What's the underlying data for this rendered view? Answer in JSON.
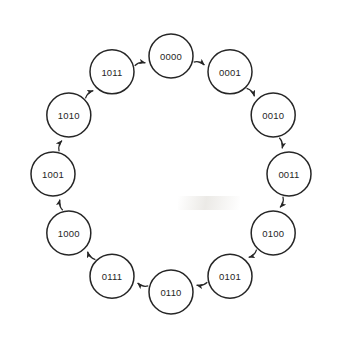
{
  "diagram": {
    "title": "",
    "type": "state-transition-cycle",
    "background_color": "#ffffff",
    "stroke_color": "#262626",
    "text_color": "#262626",
    "node_fill": "#ffffff",
    "node_radius": 22,
    "ring_radius": 118,
    "center_x": 171,
    "center_y": 174,
    "direction": "clockwise",
    "states": [
      {
        "label": "0000",
        "angle_deg": -90,
        "cx": 171,
        "cy": 56
      },
      {
        "label": "0001",
        "angle_deg": -60,
        "cx": 273,
        "cy": 115
      },
      {
        "label": "0010",
        "angle_deg": -30,
        "cx": 273,
        "cy": 115
      },
      {
        "label": "0011",
        "angle_deg": 0,
        "cx": 289,
        "cy": 174
      },
      {
        "label": "0100",
        "angle_deg": 30,
        "cx": 273,
        "cy": 233
      },
      {
        "label": "0101",
        "angle_deg": 60,
        "cx": 230,
        "cy": 276
      },
      {
        "label": "0110",
        "angle_deg": 90,
        "cx": 171,
        "cy": 292
      },
      {
        "label": "0111",
        "angle_deg": 120,
        "cx": 112,
        "cy": 276
      },
      {
        "label": "1000",
        "angle_deg": 150,
        "cx": 69,
        "cy": 233
      },
      {
        "label": "1001",
        "angle_deg": 180,
        "cx": 53,
        "cy": 174
      },
      {
        "label": "1010",
        "angle_deg": 210,
        "cx": 69,
        "cy": 115
      },
      {
        "label": "1011",
        "angle_deg": 240,
        "cx": 112,
        "cy": 72
      }
    ],
    "transitions": [
      {
        "from": "0000",
        "to": "0001"
      },
      {
        "from": "0001",
        "to": "0010"
      },
      {
        "from": "0010",
        "to": "0011"
      },
      {
        "from": "0011",
        "to": "0100"
      },
      {
        "from": "0100",
        "to": "0101"
      },
      {
        "from": "0101",
        "to": "0110"
      },
      {
        "from": "0110",
        "to": "0111"
      },
      {
        "from": "0111",
        "to": "1000"
      },
      {
        "from": "1000",
        "to": "1001"
      },
      {
        "from": "1001",
        "to": "1010"
      },
      {
        "from": "1010",
        "to": "1011"
      },
      {
        "from": "1011",
        "to": "0000"
      }
    ]
  }
}
